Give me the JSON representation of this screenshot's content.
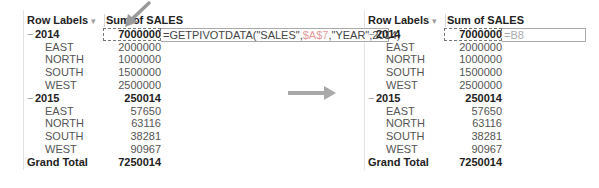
{
  "left_pivot": {
    "headers": {
      "row_labels": "Row Labels",
      "dropdown": "▾",
      "value_header": "Sum of SALES"
    },
    "formula": {
      "prefix": "=GETPIVOTDATA(\"SALES\",",
      "ref": "$A$7",
      "suffix": ",\"YEAR\",2014)"
    },
    "rows": [
      {
        "label": "2014",
        "value": "7000000"
      },
      {
        "label": "EAST",
        "value": "2000000"
      },
      {
        "label": "NORTH",
        "value": "1000000"
      },
      {
        "label": "SOUTH",
        "value": "1500000"
      },
      {
        "label": "WEST",
        "value": "2500000"
      },
      {
        "label": "2015",
        "value": "250014"
      },
      {
        "label": "EAST",
        "value": "57650"
      },
      {
        "label": "NORTH",
        "value": "63116"
      },
      {
        "label": "SOUTH",
        "value": "38281"
      },
      {
        "label": "WEST",
        "value": "90967"
      },
      {
        "label": "Grand Total",
        "value": "7250014"
      }
    ]
  },
  "right_pivot": {
    "headers": {
      "row_labels": "Row Labels",
      "dropdown": "▾",
      "value_header": "Sum of SALES"
    },
    "formula": {
      "text": "=B8"
    },
    "rows": [
      {
        "label": "2014",
        "value": "7000000"
      },
      {
        "label": "EAST",
        "value": "2000000"
      },
      {
        "label": "NORTH",
        "value": "1000000"
      },
      {
        "label": "SOUTH",
        "value": "1500000"
      },
      {
        "label": "WEST",
        "value": "2500000"
      },
      {
        "label": "2015",
        "value": "250014"
      },
      {
        "label": "EAST",
        "value": "57650"
      },
      {
        "label": "NORTH",
        "value": "63116"
      },
      {
        "label": "SOUTH",
        "value": "38281"
      },
      {
        "label": "WEST",
        "value": "90967"
      },
      {
        "label": "Grand Total",
        "value": "7250014"
      }
    ]
  },
  "icons": {
    "collapse": "−"
  },
  "colors": {
    "formula_ref": "#e59a9a",
    "arrow": "#9a9a9a"
  }
}
